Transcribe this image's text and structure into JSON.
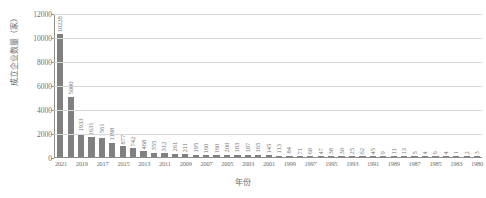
{
  "chart_data": {
    "type": "bar",
    "title": "",
    "xlabel": "年份",
    "ylabel": "成立企业数量（家）",
    "ylim": [
      0,
      12000
    ],
    "yticks": [
      0,
      2000,
      4000,
      6000,
      8000,
      10000,
      12000
    ],
    "grid": true,
    "legend": "none",
    "bar_color": "#808080",
    "categories": [
      "2021",
      "2020",
      "2019",
      "2018",
      "2017",
      "2016",
      "2015",
      "2014",
      "2013",
      "2012",
      "2011",
      "2010",
      "2009",
      "2008",
      "2007",
      "2006",
      "2005",
      "2004",
      "2003",
      "2002",
      "2001",
      "2000",
      "1999",
      "1998",
      "1997",
      "1996",
      "1995",
      "1994",
      "1993",
      "1992",
      "1991",
      "1990",
      "1989",
      "1988",
      "1987",
      "1986",
      "1985",
      "1984",
      "1983",
      "1982",
      "1980"
    ],
    "values": [
      10228,
      5000,
      1933,
      1631,
      1561,
      1198,
      877,
      742,
      468,
      355,
      312,
      261,
      211,
      195,
      160,
      160,
      200,
      183,
      187,
      165,
      145,
      113,
      84,
      71,
      68,
      47,
      38,
      30,
      25,
      62,
      45,
      9,
      11,
      13,
      5,
      4,
      6,
      4,
      1,
      2,
      3
    ],
    "value_labels": [
      "10228",
      "5000",
      "1933",
      "1631",
      "1561",
      "1198",
      "877",
      "742",
      "468",
      "355",
      "312",
      "261",
      "211",
      "195",
      "160",
      "160",
      "200",
      "183",
      "187",
      "165",
      "145",
      "113",
      "84",
      "71",
      "68",
      "47",
      "38",
      "30",
      "25",
      "62",
      "45",
      "9",
      "11",
      "13",
      "5",
      "4",
      "6",
      "4",
      "1",
      "2",
      "3"
    ],
    "xtick_labels": [
      "2021",
      "2019",
      "2017",
      "2015",
      "2013",
      "2011",
      "2009",
      "2007",
      "2005",
      "2003",
      "2001",
      "1999",
      "1997",
      "1995",
      "1993",
      "1991",
      "1989",
      "1987",
      "1985",
      "1983",
      "1980"
    ]
  }
}
